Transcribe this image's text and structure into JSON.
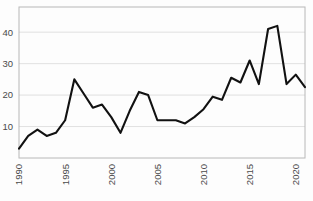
{
  "chart_data": {
    "type": "line",
    "title": "",
    "subtitle": "",
    "xlabel": "",
    "ylabel": "",
    "x": [
      1990,
      1991,
      1992,
      1993,
      1994,
      1995,
      1996,
      1997,
      1998,
      1999,
      2000,
      2001,
      2002,
      2003,
      2004,
      2005,
      2006,
      2007,
      2008,
      2009,
      2010,
      2011,
      2012,
      2013,
      2014,
      2015,
      2016,
      2017,
      2018,
      2019,
      2020,
      2021
    ],
    "values": [
      3,
      7,
      9,
      7,
      8,
      12,
      25,
      20.5,
      16,
      17,
      13,
      8,
      15,
      21,
      20,
      12,
      12,
      12,
      11,
      13,
      15.5,
      19.5,
      18.5,
      25.5,
      24,
      31,
      23.5,
      41,
      42,
      23.5,
      26.5,
      22.5
    ],
    "series": [
      {
        "name": "series-1",
        "values": [
          3,
          7,
          9,
          7,
          8,
          12,
          25,
          20.5,
          16,
          17,
          13,
          8,
          15,
          21,
          20,
          12,
          12,
          12,
          11,
          13,
          15.5,
          19.5,
          18.5,
          25.5,
          24,
          31,
          23.5,
          41,
          42,
          23.5,
          26.5,
          22.5
        ],
        "color": "#111111"
      }
    ],
    "xlim": [
      1990,
      2021
    ],
    "ylim": [
      0,
      48
    ],
    "yticks": [
      10,
      20,
      30,
      40
    ],
    "ytick_labels": [
      "10",
      "20",
      "30",
      "40"
    ],
    "xticks": [
      1990,
      1995,
      2000,
      2005,
      2010,
      2015,
      2020
    ],
    "xtick_labels": [
      "1990",
      "1995",
      "2000",
      "2005",
      "2010",
      "2015",
      "2020"
    ],
    "xtick_rotation": -90,
    "grid": "horizontal",
    "legend": "none",
    "colors": {
      "line": "#111111",
      "grid": "#d9d9d9",
      "frame": "#b8b8b8",
      "tick_text": "#4a4a4a",
      "background": "#fdfdfd"
    }
  },
  "plot_geometry": {
    "left": 19,
    "right": 305,
    "top": 7,
    "bottom": 158
  }
}
